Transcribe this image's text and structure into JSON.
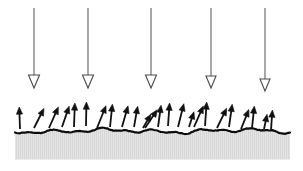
{
  "figure": {
    "title": "",
    "caption": "",
    "type": "schematic-diagram",
    "canvas": {
      "width": 303,
      "height": 171,
      "background": "#ffffff"
    }
  },
  "colors": {
    "background": "#ffffff",
    "incident_arrow_stroke": "#6d6d6d",
    "incident_arrow_head_outline": "#4a4a4a",
    "incident_arrow_head_fill": "#ffffff",
    "emitted_arrow": "#111111",
    "surface_line": "#0d0d0d",
    "substrate_fill": "#e3e3e3",
    "substrate_hatch": "#cfcfcf"
  },
  "incident_beam": {
    "name": "incident-beam",
    "label": "incident arrows",
    "count": 5,
    "direction": "downward",
    "head_style": "hollow-triangle",
    "shaft_width_px": 1.2,
    "arrows": [
      {
        "id": "incident-1",
        "x": 34,
        "y_start": 8,
        "y_end": 88,
        "head_w": 11,
        "head_h": 13
      },
      {
        "id": "incident-2",
        "x": 88,
        "y_start": 8,
        "y_end": 88,
        "head_w": 11,
        "head_h": 13
      },
      {
        "id": "incident-3",
        "x": 151,
        "y_start": 8,
        "y_end": 88,
        "head_w": 11,
        "head_h": 13
      },
      {
        "id": "incident-4",
        "x": 211,
        "y_start": 8,
        "y_end": 88,
        "head_w": 10,
        "head_h": 12
      },
      {
        "id": "incident-5",
        "x": 265,
        "y_start": 8,
        "y_end": 91,
        "head_w": 10,
        "head_h": 12
      }
    ]
  },
  "emitted_particles": {
    "name": "emitted-arrows",
    "label": "emitted / scattered arrows",
    "count": 24,
    "direction": "upward",
    "head_style": "solid-triangle",
    "arrows": [
      {
        "id": "emitted-1",
        "x": 20,
        "y": 129,
        "len": 22,
        "angle": -2
      },
      {
        "id": "emitted-2",
        "x": 34,
        "y": 128,
        "len": 22,
        "angle": 27
      },
      {
        "id": "emitted-3",
        "x": 49,
        "y": 128,
        "len": 23,
        "angle": 24
      },
      {
        "id": "emitted-4",
        "x": 62,
        "y": 127,
        "len": 22,
        "angle": 19
      },
      {
        "id": "emitted-5",
        "x": 74,
        "y": 127,
        "len": 24,
        "angle": 2
      },
      {
        "id": "emitted-6",
        "x": 86,
        "y": 126,
        "len": 24,
        "angle": 1
      },
      {
        "id": "emitted-7",
        "x": 97,
        "y": 128,
        "len": 24,
        "angle": 22
      },
      {
        "id": "emitted-8",
        "x": 110,
        "y": 127,
        "len": 23,
        "angle": 6
      },
      {
        "id": "emitted-9",
        "x": 122,
        "y": 127,
        "len": 22,
        "angle": 16
      },
      {
        "id": "emitted-10",
        "x": 134,
        "y": 127,
        "len": 21,
        "angle": 10
      },
      {
        "id": "emitted-11",
        "x": 145,
        "y": 128,
        "len": 22,
        "angle": 34
      },
      {
        "id": "emitted-12",
        "x": 158,
        "y": 127,
        "len": 22,
        "angle": 8
      },
      {
        "id": "emitted-13",
        "x": 168,
        "y": 126,
        "len": 23,
        "angle": 4
      },
      {
        "id": "emitted-14",
        "x": 178,
        "y": 127,
        "len": 24,
        "angle": 14
      },
      {
        "id": "emitted-15",
        "x": 194,
        "y": 127,
        "len": 23,
        "angle": 24
      },
      {
        "id": "emitted-16",
        "x": 205,
        "y": 126,
        "len": 24,
        "angle": 4
      },
      {
        "id": "emitted-17",
        "x": 217,
        "y": 128,
        "len": 22,
        "angle": 26
      },
      {
        "id": "emitted-18",
        "x": 229,
        "y": 127,
        "len": 23,
        "angle": 8
      },
      {
        "id": "emitted-19",
        "x": 241,
        "y": 129,
        "len": 21,
        "angle": 22
      },
      {
        "id": "emitted-20",
        "x": 252,
        "y": 128,
        "len": 22,
        "angle": 6
      },
      {
        "id": "emitted-21",
        "x": 271,
        "y": 130,
        "len": 20,
        "angle": 4
      },
      {
        "id": "emitted-22",
        "x": 143,
        "y": 128,
        "len": 16,
        "angle": 30
      },
      {
        "id": "emitted-23",
        "x": 189,
        "y": 127,
        "len": 16,
        "angle": 18
      },
      {
        "id": "emitted-24",
        "x": 264,
        "y": 129,
        "len": 15,
        "angle": 12
      }
    ]
  },
  "surface": {
    "name": "rough-surface-line",
    "label": "rough surface profile",
    "stroke_width_px": 2.2,
    "x_start": 15,
    "x_end": 290,
    "base_y": 131,
    "roughness_amplitude_px": 3
  },
  "substrate": {
    "name": "substrate-block",
    "label": "substrate (bulk material)",
    "x": 15,
    "y": 131,
    "width": 275,
    "height": 28,
    "fill": "#e3e3e3",
    "hatch": "vertical-fine"
  }
}
